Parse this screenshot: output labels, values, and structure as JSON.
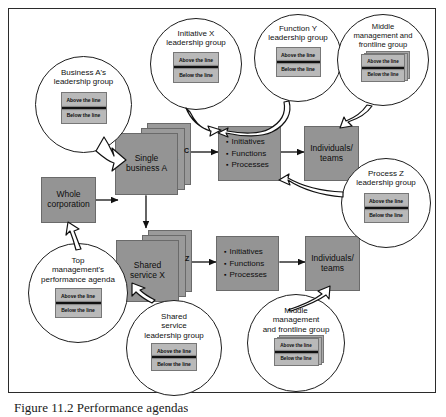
{
  "figure": {
    "caption": "Figure 11.2 Performance agendas"
  },
  "line_widget": {
    "above_label": "Above the line",
    "below_label": "Below the line"
  },
  "boxes": {
    "single_business": {
      "label": "Single\nbusiness A",
      "stack_letters": [
        "B",
        "C"
      ]
    },
    "shared_service": {
      "label": "Shared\nservice X",
      "stack_letters": [
        "Y",
        "Z"
      ]
    },
    "whole_corporation": {
      "label": "Whole\ncorporation"
    },
    "individuals_top": {
      "label": "Individuals/\nteams"
    },
    "individuals_bottom": {
      "label": "Individuals/\nteams"
    },
    "ifp_top": {
      "items": [
        "Initiatives",
        "Functions",
        "Processes"
      ]
    },
    "ifp_bottom": {
      "items": [
        "Initiatives",
        "Functions",
        "Processes"
      ]
    }
  },
  "circles": {
    "business_a": {
      "title": "Business A's\nleadership group",
      "stacked": false
    },
    "initiative_x": {
      "title": "Initiative X\nleadership group",
      "stacked": false
    },
    "function_y": {
      "title": "Function Y\nleadership group",
      "stacked": false
    },
    "middle_mgmt_top": {
      "title": "Middle\nmanagement and\nfrontline group",
      "stacked": true
    },
    "process_z": {
      "title": "Process Z\nleadership group",
      "stacked": false
    },
    "top_management": {
      "title": "Top\nmanagement's\nperformance agenda",
      "stacked": false
    },
    "shared_service_leadership": {
      "title": "Shared\nservice\nleadership group",
      "stacked": false
    },
    "middle_mgmt_bottom": {
      "title": "Middle\nmanagement\nand frontline group",
      "stacked": true
    }
  },
  "colors": {
    "box_fill": "#949494",
    "box_stroke": "#6a6a6a",
    "line_widget_fill": "#b9b9b9",
    "stroke": "#1d1d1d",
    "page": "#ffffff"
  }
}
